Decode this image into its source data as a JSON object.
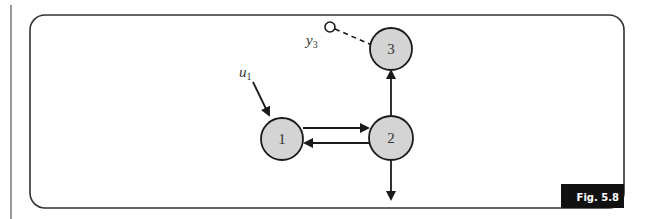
{
  "figure": {
    "caption": "Fig. 5.8",
    "colors": {
      "stroke": "#1a1a1a",
      "node_fill": "#d4d4d4",
      "caption_bg": "#111111",
      "caption_text": "#ffffff"
    }
  },
  "nodes": [
    {
      "id": "1",
      "label": "1"
    },
    {
      "id": "2",
      "label": "2"
    },
    {
      "id": "3",
      "label": "3"
    }
  ],
  "inputs": [
    {
      "name": "u",
      "subscript": "1",
      "target": "1"
    }
  ],
  "outputs": [
    {
      "name": "y",
      "subscript": "3",
      "source": "3",
      "style": "dashed"
    }
  ],
  "edges": [
    {
      "from": "1",
      "to": "2"
    },
    {
      "from": "2",
      "to": "1"
    },
    {
      "from": "2",
      "to": "3"
    },
    {
      "from": "2",
      "to": "out"
    }
  ]
}
